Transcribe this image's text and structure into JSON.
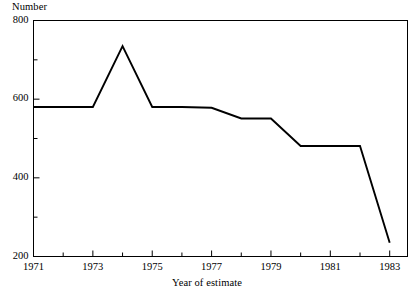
{
  "chart_data": {
    "type": "line",
    "title": "",
    "ylabel": "Number",
    "xlabel": "Year of estimate",
    "ylim": [
      200,
      800
    ],
    "xlim": [
      1971,
      1983.6
    ],
    "grid": false,
    "legend": null,
    "y_ticks_major": [
      200,
      400,
      600,
      800
    ],
    "y_ticks_minor": [
      300,
      500,
      700
    ],
    "y_tick_labels": [
      "200",
      "400",
      "600",
      "800"
    ],
    "x_ticks_major": [
      1971,
      1973,
      1975,
      1977,
      1979,
      1981,
      1983
    ],
    "x_ticks_minor": [
      1972,
      1974,
      1976,
      1978,
      1980,
      1982
    ],
    "x_tick_labels": [
      "1971",
      "1973",
      "1975",
      "1977",
      "1979",
      "1981",
      "1983"
    ],
    "x": [
      1971,
      1972,
      1973,
      1974,
      1975,
      1976,
      1977,
      1978,
      1979,
      1980,
      1981,
      1982,
      1983
    ],
    "values": [
      580,
      580,
      580,
      735,
      580,
      580,
      578,
      551,
      551,
      481,
      481,
      481,
      235
    ],
    "series": [
      {
        "name": "Number",
        "color": "#000000",
        "values": [
          580,
          580,
          580,
          735,
          580,
          580,
          578,
          551,
          551,
          481,
          481,
          481,
          235
        ]
      }
    ]
  },
  "axis": {
    "y_title": "Number",
    "x_title": "Year of estimate"
  },
  "style": {
    "line_color": "#000000",
    "frame_color": "#000000",
    "background": "#ffffff"
  }
}
